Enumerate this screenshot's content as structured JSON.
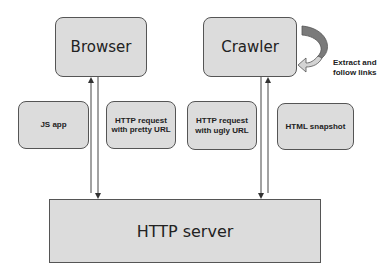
{
  "diagram": {
    "nodes": {
      "browser": {
        "label": "Browser"
      },
      "crawler": {
        "label": "Crawler"
      },
      "js_app": {
        "label": "JS app"
      },
      "pretty_request": {
        "label": "HTTP request with pretty URL"
      },
      "ugly_request": {
        "label": "HTTP request with ugly URL"
      },
      "html_snapshot": {
        "label": "HTML snapshot"
      },
      "http_server": {
        "label": "HTTP server"
      }
    },
    "annotations": {
      "crawler_loop": {
        "line1": "Extract and",
        "line2": "follow links"
      }
    },
    "edges": [
      {
        "from": "http_server",
        "to": "browser"
      },
      {
        "from": "browser",
        "to": "http_server"
      },
      {
        "from": "crawler",
        "to": "http_server"
      },
      {
        "from": "http_server",
        "to": "crawler"
      },
      {
        "from": "crawler",
        "to": "crawler",
        "label": "Extract and follow links"
      }
    ],
    "colors": {
      "box_fill": "#dcdcdc",
      "box_border": "#555555",
      "arrow": "#333333",
      "loop_arrow_dark": "#7a7a7a",
      "loop_arrow_light": "#d4d4d4"
    }
  }
}
